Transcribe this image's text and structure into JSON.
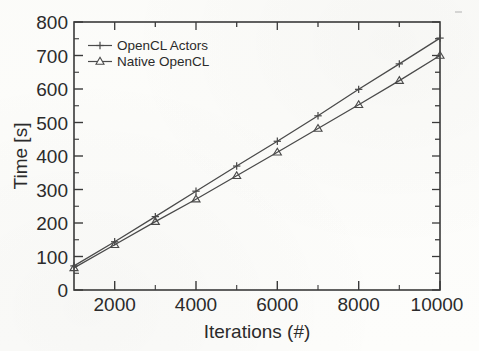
{
  "chart_data": {
    "type": "line",
    "title": "",
    "xlabel": "Iterations (#)",
    "ylabel": "Time [s]",
    "xlim": [
      1000,
      10000
    ],
    "ylim": [
      0,
      800
    ],
    "x": [
      1000,
      2000,
      3000,
      4000,
      5000,
      6000,
      7000,
      8000,
      9000,
      10000
    ],
    "xticks": [
      2000,
      4000,
      6000,
      8000,
      10000
    ],
    "xticklabels": [
      "2000",
      "4000",
      "6000",
      "8000",
      "10000"
    ],
    "yticks": [
      0,
      100,
      200,
      300,
      400,
      500,
      600,
      700,
      800
    ],
    "yticklabels": [
      "0",
      "100",
      "200",
      "300",
      "400",
      "500",
      "600",
      "700",
      "800"
    ],
    "grid": false,
    "legend_position": "upper left",
    "series": [
      {
        "name": "OpenCL Actors",
        "marker": "plus",
        "values": [
          72,
          144,
          219,
          295,
          370,
          444,
          520,
          599,
          675,
          752
        ]
      },
      {
        "name": "Native OpenCL",
        "marker": "triangle-open",
        "values": [
          66,
          135,
          204,
          271,
          341,
          411,
          482,
          553,
          625,
          700
        ]
      }
    ]
  },
  "axes": {
    "y_axis_title": "Time [s]",
    "x_axis_title": "Iterations (#)",
    "y_tick_labels": [
      "800",
      "700",
      "600",
      "500",
      "400",
      "300",
      "200",
      "100",
      "0"
    ],
    "x_tick_labels": [
      "2000",
      "4000",
      "6000",
      "8000",
      "10000"
    ]
  },
  "legend": {
    "entries": [
      {
        "label": "OpenCL Actors",
        "marker": "plus-marker"
      },
      {
        "label": "Native OpenCL",
        "marker": "triangle-marker"
      }
    ]
  },
  "style": {
    "line_color": "#4a4a4a",
    "axis_color": "#3a3a3a",
    "text_color": "#2b2b2b",
    "background": "#fdfdfb"
  }
}
